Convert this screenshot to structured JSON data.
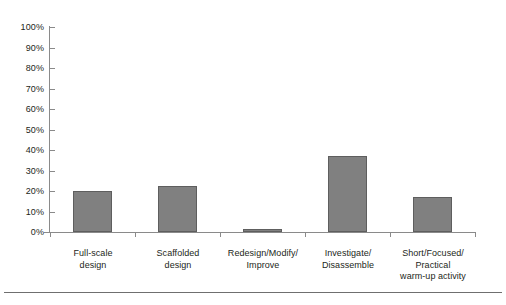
{
  "chart_data": {
    "type": "bar",
    "title": "",
    "subtitle": "",
    "xlabel": "",
    "ylabel": "",
    "ylim": [
      0,
      100
    ],
    "ytick_step": 10,
    "grid": false,
    "legend": false,
    "legend_position": "none",
    "bar_color": "#808080",
    "bar_border_color": "#5e5e5e",
    "axis_color": "#8a8a8a",
    "background": "#ffffff",
    "categories": [
      "Full-scale design",
      "Scaffolded design",
      "Redesign/Modify/Improve",
      "Investigate/Disassemble",
      "Short/Focused/Practical warm-up activity"
    ],
    "category_lines": [
      [
        "Full-scale",
        "design"
      ],
      [
        "Scaffolded",
        "design"
      ],
      [
        "Redesign/Modify/",
        "Improve"
      ],
      [
        "Investigate/",
        "Disassemble"
      ],
      [
        "Short/Focused/",
        "Practical",
        "warm-up activity"
      ]
    ],
    "values": [
      20,
      22.5,
      1.5,
      37,
      17
    ],
    "value_labels": [
      "20%",
      "22.5%",
      "1.5%",
      "37%",
      "17%"
    ],
    "ytick_labels": [
      "0%",
      "10%",
      "20%",
      "30%",
      "40%",
      "50%",
      "60%",
      "70%",
      "80%",
      "90%",
      "100%"
    ],
    "ytick_values": [
      0,
      10,
      20,
      30,
      40,
      50,
      60,
      70,
      80,
      90,
      100
    ]
  }
}
